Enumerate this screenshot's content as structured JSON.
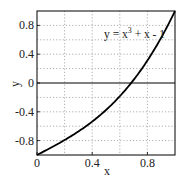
{
  "chart_data": {
    "type": "line",
    "title": "",
    "xlabel": "x",
    "ylabel": "y",
    "xlim": [
      0,
      1
    ],
    "ylim": [
      -1,
      1
    ],
    "grid": true,
    "grid_style": "dotted",
    "x_ticks": [
      0,
      0.4,
      0.8
    ],
    "x_tick_labels": [
      "0",
      "0.4",
      "0.8"
    ],
    "y_ticks": [
      -0.8,
      -0.4,
      0,
      0.4,
      0.8
    ],
    "y_tick_labels": [
      "-0.8",
      "-0.4",
      "0",
      "0.4",
      "0.8"
    ],
    "minor_grid_step": 0.2,
    "annotation": {
      "text_prefix": "y = x",
      "superscript": "3",
      "text_suffix": " + x - 1",
      "x": 0.5,
      "y": 0.7
    },
    "series": [
      {
        "name": "y = x^3 + x - 1",
        "color": "#000000",
        "x": [
          0,
          0.1,
          0.2,
          0.3,
          0.4,
          0.5,
          0.6,
          0.682,
          0.7,
          0.8,
          0.9,
          1.0
        ],
        "y": [
          -1.0,
          -0.899,
          -0.792,
          -0.673,
          -0.536,
          -0.375,
          -0.184,
          0.0,
          0.043,
          0.312,
          0.629,
          1.0
        ]
      }
    ],
    "reference_lines": [
      {
        "axis": "y",
        "value": 0,
        "color": "#000000"
      }
    ]
  }
}
